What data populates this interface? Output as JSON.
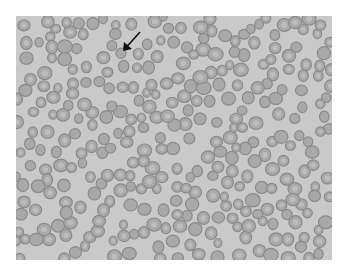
{
  "figure": {
    "background_color": "#c9c9c9",
    "cell_fill": "#a9a9a9",
    "cell_rim": "#8a8a8a",
    "cell_center": "#bdbdbd",
    "arrow_color": "#111111",
    "arrow": {
      "x1": 140,
      "y1": 32,
      "x2": 123,
      "y2": 51,
      "direction": "down-left"
    }
  }
}
